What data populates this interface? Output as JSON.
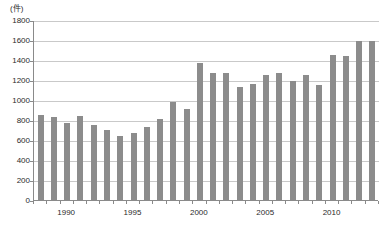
{
  "chart_data": {
    "type": "bar",
    "title": "",
    "subtitle": "",
    "unit_label": "(件)",
    "xlabel": "",
    "ylabel": "",
    "ylim": [
      0,
      1800
    ],
    "ytick_step": 200,
    "yticks": [
      0,
      200,
      400,
      600,
      800,
      1000,
      1200,
      1400,
      1600,
      1800
    ],
    "ytick_labels": [
      "0",
      "200",
      "400",
      "600",
      "800",
      "1000",
      "1200",
      "1400",
      "1600",
      "1800"
    ],
    "xtick_labels": [
      "1990",
      "1995",
      "2000",
      "2005",
      "2010"
    ],
    "xtick_years": [
      1990,
      1995,
      2000,
      2005,
      2010
    ],
    "grid": true,
    "legend": false,
    "bar_color": "#8c8c8c",
    "grid_color": "#c9c9c9",
    "axis_color": "#8a8a8a",
    "text_color": "#2b2b2b",
    "categories": [
      "1988",
      "1989",
      "1990",
      "1991",
      "1992",
      "1993",
      "1994",
      "1995",
      "1996",
      "1997",
      "1998",
      "1999",
      "2000",
      "2001",
      "2002",
      "2003",
      "2004",
      "2005",
      "2006",
      "2007",
      "2008",
      "2009",
      "2010",
      "2011",
      "2012",
      "2013"
    ],
    "values": [
      850,
      830,
      770,
      840,
      750,
      700,
      645,
      675,
      735,
      815,
      985,
      910,
      1370,
      1270,
      1270,
      1135,
      1165,
      1255,
      1270,
      1190,
      1255,
      1155,
      1455,
      1445,
      1595,
      1595
    ]
  }
}
